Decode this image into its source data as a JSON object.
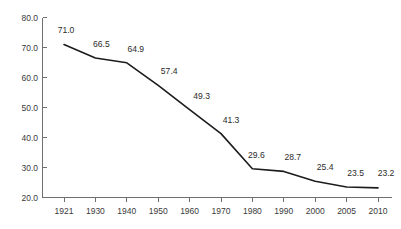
{
  "chart_data": {
    "type": "line",
    "title": "",
    "subtitle": "",
    "xlabel": "",
    "ylabel": "",
    "categories": [
      "1921",
      "1930",
      "1940",
      "1950",
      "1960",
      "1970",
      "1980",
      "1990",
      "2000",
      "2005",
      "2010"
    ],
    "values": [
      71.0,
      66.5,
      64.9,
      57.4,
      49.3,
      41.3,
      29.6,
      28.7,
      25.4,
      23.5,
      23.2
    ],
    "point_labels": [
      "71.0",
      "66.5",
      "64.9",
      "57.4",
      "49.3",
      "41.3",
      "29.6",
      "28.7",
      "25.4",
      "23.5",
      "23.2"
    ],
    "ylim": [
      20.0,
      80.0
    ],
    "ytick_values": [
      20.0,
      30.0,
      40.0,
      50.0,
      60.0,
      70.0,
      80.0
    ],
    "ytick_labels": [
      "20.0",
      "30.0",
      "40.0",
      "50.0",
      "60.0",
      "70.0",
      "80.0"
    ],
    "xtick_labels": [
      "1921",
      "1930",
      "1940",
      "1950",
      "1960",
      "1970",
      "1980",
      "1990",
      "2000",
      "2005",
      "2010"
    ],
    "grid": false,
    "legend": null,
    "legend_position": "none",
    "series": [
      {
        "name": "",
        "values": [
          71.0,
          66.5,
          64.9,
          57.4,
          49.3,
          41.3,
          29.6,
          28.7,
          25.4,
          23.5,
          23.2
        ]
      }
    ],
    "colors": {
      "line": "#1c1c1c",
      "axis": "#6f6f6f",
      "label_text": "#2b2b2b",
      "background": "#ffffff"
    }
  }
}
